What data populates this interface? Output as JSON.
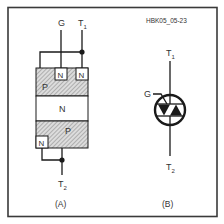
{
  "figure_id": "HBK05_05-23",
  "colors": {
    "line": "#1a1a1a",
    "border": "#3a3a3a",
    "text": "#333333",
    "hatch": "#9a9a9a",
    "background": "#ffffff"
  },
  "panel_a": {
    "caption": "(A)",
    "terminals": {
      "gate": "G",
      "t1_main": "T",
      "t1_sub": "1",
      "t2_main": "T",
      "t2_sub": "2"
    },
    "layers": {
      "top_p": "P",
      "top_n_gate": "N",
      "top_n_t1": "N",
      "middle_n": "N",
      "bottom_p": "P",
      "bottom_n": "N"
    }
  },
  "panel_b": {
    "caption": "(B)",
    "terminals": {
      "gate": "G",
      "t1_main": "T",
      "t1_sub": "1",
      "t2_main": "T",
      "t2_sub": "2"
    },
    "symbol": "triac-icon"
  }
}
